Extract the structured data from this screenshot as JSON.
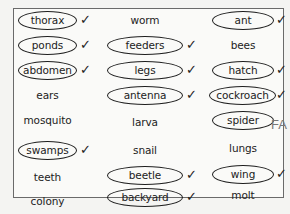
{
  "worksheet": {
    "columns": [
      {
        "items": [
          {
            "word": "thorax",
            "circled": true,
            "check": "✓"
          },
          {
            "word": "ponds",
            "circled": true,
            "check": "✓"
          },
          {
            "word": "abdomen",
            "circled": true,
            "check": "✓"
          },
          {
            "word": "ears",
            "circled": false,
            "check": ""
          },
          {
            "word": "mosquito",
            "circled": false,
            "check": ""
          },
          {
            "word": "swamps",
            "circled": true,
            "check": "✓"
          },
          {
            "word": "teeth",
            "circled": false,
            "check": ""
          },
          {
            "word": "colony",
            "circled": false,
            "check": ""
          }
        ]
      },
      {
        "items": [
          {
            "word": "worm",
            "circled": false,
            "check": ""
          },
          {
            "word": "feeders",
            "circled": true,
            "check": "✓"
          },
          {
            "word": "legs",
            "circled": true,
            "check": "✓"
          },
          {
            "word": "antenna",
            "circled": true,
            "check": "✓"
          },
          {
            "word": "larva",
            "circled": false,
            "check": ""
          },
          {
            "word": "snail",
            "circled": false,
            "check": ""
          },
          {
            "word": "beetle",
            "circled": true,
            "check": "✓"
          },
          {
            "word": "backyard",
            "circled": true,
            "check": "✓"
          },
          {
            "word": "bugs",
            "circled": true,
            "check": "✓"
          }
        ]
      },
      {
        "items": [
          {
            "word": "ant",
            "circled": true,
            "check": "✓"
          },
          {
            "word": "bees",
            "circled": false,
            "check": ""
          },
          {
            "word": "hatch",
            "circled": true,
            "check": "✓"
          },
          {
            "word": "cockroach",
            "circled": true,
            "check": "✓"
          },
          {
            "word": "spider",
            "circled": true,
            "check": "",
            "annotation": "FA"
          },
          {
            "word": "lungs",
            "circled": false,
            "check": ""
          },
          {
            "word": "wing",
            "circled": true,
            "check": "✓"
          },
          {
            "word": "molt",
            "circled": false,
            "check": ""
          }
        ]
      }
    ]
  }
}
